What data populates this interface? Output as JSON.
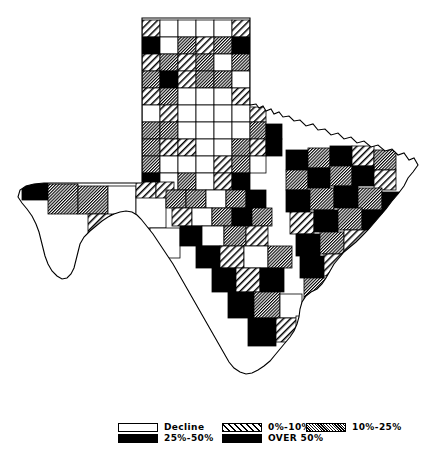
{
  "figure": {
    "kind": "choropleth-map",
    "region": "Texas",
    "unit": "county",
    "background_color": "#ffffff",
    "ink_color": "#000000"
  },
  "legend": {
    "groups": [
      {
        "name": "legend-group-1",
        "rows": [
          {
            "pattern": "white",
            "label": "Decline"
          },
          {
            "pattern": "black",
            "label": "25%-50%"
          }
        ]
      },
      {
        "name": "legend-group-2",
        "rows": [
          {
            "pattern": "diagonal-hatch",
            "label": "0%-10%"
          },
          {
            "pattern": "black",
            "label": "OVER 50%"
          }
        ]
      },
      {
        "name": "legend-group-3",
        "rows": [
          {
            "pattern": "dense-hatch",
            "label": "10%-25%"
          }
        ]
      }
    ]
  },
  "chart_data": {
    "type": "map",
    "title": "",
    "classes": [
      {
        "key": "decline",
        "label": "Decline",
        "pattern": "white"
      },
      {
        "key": "c0_10",
        "label": "0%-10%",
        "pattern": "diagonal-hatch"
      },
      {
        "key": "c10_25",
        "label": "10%-25%",
        "pattern": "dense-hatch"
      },
      {
        "key": "c25_50",
        "label": "25%-50%",
        "pattern": "black"
      },
      {
        "key": "over50",
        "label": "OVER 50%",
        "pattern": "black"
      }
    ],
    "regions": [
      {
        "id": "panhandle-r1c1",
        "cls": "c0_10",
        "x": 142,
        "y": 20,
        "w": 18,
        "h": 17
      },
      {
        "id": "panhandle-r1c2",
        "cls": "decline",
        "x": 160,
        "y": 20,
        "w": 18,
        "h": 17
      },
      {
        "id": "panhandle-r1c3",
        "cls": "decline",
        "x": 178,
        "y": 20,
        "w": 18,
        "h": 17
      },
      {
        "id": "panhandle-r1c4",
        "cls": "decline",
        "x": 196,
        "y": 20,
        "w": 18,
        "h": 17
      },
      {
        "id": "panhandle-r1c5",
        "cls": "decline",
        "x": 214,
        "y": 20,
        "w": 18,
        "h": 17
      },
      {
        "id": "panhandle-r1c6",
        "cls": "c0_10",
        "x": 232,
        "y": 20,
        "w": 18,
        "h": 17
      },
      {
        "id": "panhandle-r2c1",
        "cls": "over50",
        "x": 142,
        "y": 37,
        "w": 18,
        "h": 17
      },
      {
        "id": "panhandle-r2c2",
        "cls": "decline",
        "x": 160,
        "y": 37,
        "w": 18,
        "h": 17
      },
      {
        "id": "panhandle-r2c3",
        "cls": "c10_25",
        "x": 178,
        "y": 37,
        "w": 18,
        "h": 17
      },
      {
        "id": "panhandle-r2c4",
        "cls": "c0_10",
        "x": 196,
        "y": 37,
        "w": 18,
        "h": 17
      },
      {
        "id": "panhandle-r2c5",
        "cls": "c10_25",
        "x": 214,
        "y": 37,
        "w": 18,
        "h": 17
      },
      {
        "id": "panhandle-r2c6",
        "cls": "over50",
        "x": 232,
        "y": 37,
        "w": 18,
        "h": 17
      },
      {
        "id": "panhandle-r3c1",
        "cls": "c0_10",
        "x": 142,
        "y": 54,
        "w": 18,
        "h": 17
      },
      {
        "id": "panhandle-r3c2",
        "cls": "c10_25",
        "x": 160,
        "y": 54,
        "w": 18,
        "h": 17
      },
      {
        "id": "panhandle-r3c3",
        "cls": "c0_10",
        "x": 178,
        "y": 54,
        "w": 18,
        "h": 17
      },
      {
        "id": "panhandle-r3c4",
        "cls": "c10_25",
        "x": 196,
        "y": 54,
        "w": 18,
        "h": 17
      },
      {
        "id": "panhandle-r3c5",
        "cls": "decline",
        "x": 214,
        "y": 54,
        "w": 18,
        "h": 17
      },
      {
        "id": "panhandle-r3c6",
        "cls": "c10_25",
        "x": 232,
        "y": 54,
        "w": 18,
        "h": 17
      },
      {
        "id": "panhandle-r4c1",
        "cls": "c10_25",
        "x": 142,
        "y": 71,
        "w": 18,
        "h": 17
      },
      {
        "id": "panhandle-r4c2",
        "cls": "over50",
        "x": 160,
        "y": 71,
        "w": 18,
        "h": 17
      },
      {
        "id": "panhandle-r4c3",
        "cls": "c0_10",
        "x": 178,
        "y": 71,
        "w": 18,
        "h": 17
      },
      {
        "id": "panhandle-r4c4",
        "cls": "c10_25",
        "x": 196,
        "y": 71,
        "w": 18,
        "h": 17
      },
      {
        "id": "panhandle-r4c5",
        "cls": "c10_25",
        "x": 214,
        "y": 71,
        "w": 18,
        "h": 17
      },
      {
        "id": "panhandle-r4c6",
        "cls": "decline",
        "x": 232,
        "y": 71,
        "w": 18,
        "h": 17
      },
      {
        "id": "panhandle-r5c1",
        "cls": "c0_10",
        "x": 142,
        "y": 88,
        "w": 18,
        "h": 17
      },
      {
        "id": "panhandle-r5c2",
        "cls": "c10_25",
        "x": 160,
        "y": 88,
        "w": 18,
        "h": 17
      },
      {
        "id": "panhandle-r5c3",
        "cls": "decline",
        "x": 178,
        "y": 88,
        "w": 18,
        "h": 17
      },
      {
        "id": "panhandle-r5c4",
        "cls": "decline",
        "x": 196,
        "y": 88,
        "w": 18,
        "h": 17
      },
      {
        "id": "panhandle-r5c5",
        "cls": "decline",
        "x": 214,
        "y": 88,
        "w": 18,
        "h": 17
      },
      {
        "id": "panhandle-r5c6",
        "cls": "c0_10",
        "x": 232,
        "y": 88,
        "w": 18,
        "h": 17
      },
      {
        "id": "nw-r6c1",
        "cls": "decline",
        "x": 142,
        "y": 105,
        "w": 18,
        "h": 17
      },
      {
        "id": "nw-r6c2",
        "cls": "c0_10",
        "x": 160,
        "y": 105,
        "w": 18,
        "h": 17
      },
      {
        "id": "nw-r6c3",
        "cls": "decline",
        "x": 178,
        "y": 105,
        "w": 18,
        "h": 17
      },
      {
        "id": "nw-r6c4",
        "cls": "decline",
        "x": 196,
        "y": 105,
        "w": 18,
        "h": 17
      },
      {
        "id": "nw-r6c5",
        "cls": "decline",
        "x": 214,
        "y": 105,
        "w": 18,
        "h": 17
      },
      {
        "id": "nw-r6c6",
        "cls": "decline",
        "x": 232,
        "y": 105,
        "w": 18,
        "h": 17
      },
      {
        "id": "nw-r6c7",
        "cls": "c0_10",
        "x": 250,
        "y": 107,
        "w": 16,
        "h": 15
      },
      {
        "id": "nw-r7c1",
        "cls": "c10_25",
        "x": 142,
        "y": 122,
        "w": 18,
        "h": 17
      },
      {
        "id": "nw-r7c2",
        "cls": "c10_25",
        "x": 160,
        "y": 122,
        "w": 18,
        "h": 17
      },
      {
        "id": "nw-r7c3",
        "cls": "decline",
        "x": 178,
        "y": 122,
        "w": 18,
        "h": 17
      },
      {
        "id": "nw-r7c4",
        "cls": "decline",
        "x": 196,
        "y": 122,
        "w": 18,
        "h": 17
      },
      {
        "id": "nw-r7c5",
        "cls": "decline",
        "x": 214,
        "y": 122,
        "w": 18,
        "h": 17
      },
      {
        "id": "nw-r7c6",
        "cls": "decline",
        "x": 232,
        "y": 122,
        "w": 18,
        "h": 17
      },
      {
        "id": "nw-r7c7",
        "cls": "c10_25",
        "x": 250,
        "y": 122,
        "w": 16,
        "h": 17
      },
      {
        "id": "nw-r7c8",
        "cls": "over50",
        "x": 266,
        "y": 124,
        "w": 16,
        "h": 15
      },
      {
        "id": "nc-r8c1",
        "cls": "c10_25",
        "x": 142,
        "y": 139,
        "w": 18,
        "h": 17
      },
      {
        "id": "nc-r8c2",
        "cls": "c0_10",
        "x": 160,
        "y": 139,
        "w": 18,
        "h": 17
      },
      {
        "id": "nc-r8c3",
        "cls": "c0_10",
        "x": 178,
        "y": 139,
        "w": 18,
        "h": 17
      },
      {
        "id": "nc-r8c4",
        "cls": "decline",
        "x": 196,
        "y": 139,
        "w": 18,
        "h": 17
      },
      {
        "id": "nc-r8c5",
        "cls": "decline",
        "x": 214,
        "y": 139,
        "w": 18,
        "h": 17
      },
      {
        "id": "nc-r8c6",
        "cls": "c10_25",
        "x": 232,
        "y": 139,
        "w": 18,
        "h": 17
      },
      {
        "id": "nc-r8c7",
        "cls": "c0_10",
        "x": 250,
        "y": 139,
        "w": 16,
        "h": 17
      },
      {
        "id": "nc-r8c8",
        "cls": "over50",
        "x": 266,
        "y": 139,
        "w": 16,
        "h": 17
      },
      {
        "id": "nc-r9c1",
        "cls": "c10_25",
        "x": 142,
        "y": 156,
        "w": 18,
        "h": 17
      },
      {
        "id": "nc-r9c2",
        "cls": "decline",
        "x": 160,
        "y": 156,
        "w": 18,
        "h": 17
      },
      {
        "id": "nc-r9c3",
        "cls": "decline",
        "x": 178,
        "y": 156,
        "w": 18,
        "h": 17
      },
      {
        "id": "nc-r9c4",
        "cls": "decline",
        "x": 196,
        "y": 156,
        "w": 18,
        "h": 17
      },
      {
        "id": "nc-r9c5",
        "cls": "c0_10",
        "x": 214,
        "y": 156,
        "w": 18,
        "h": 17
      },
      {
        "id": "nc-r9c6",
        "cls": "c10_25",
        "x": 232,
        "y": 156,
        "w": 18,
        "h": 17
      },
      {
        "id": "nc-r9c7",
        "cls": "decline",
        "x": 250,
        "y": 156,
        "w": 16,
        "h": 17
      },
      {
        "id": "nc-r10c1",
        "cls": "over50",
        "x": 142,
        "y": 173,
        "w": 18,
        "h": 17
      },
      {
        "id": "nc-r10c2",
        "cls": "decline",
        "x": 160,
        "y": 173,
        "w": 18,
        "h": 17
      },
      {
        "id": "nc-r10c3",
        "cls": "c10_25",
        "x": 178,
        "y": 173,
        "w": 18,
        "h": 17
      },
      {
        "id": "nc-r10c4",
        "cls": "decline",
        "x": 196,
        "y": 173,
        "w": 18,
        "h": 17
      },
      {
        "id": "nc-r10c5",
        "cls": "c0_10",
        "x": 214,
        "y": 173,
        "w": 18,
        "h": 17
      },
      {
        "id": "nc-r10c6",
        "cls": "over50",
        "x": 232,
        "y": 173,
        "w": 18,
        "h": 17
      },
      {
        "id": "wtx-elpaso",
        "cls": "over50",
        "x": 22,
        "y": 182,
        "w": 26,
        "h": 18
      },
      {
        "id": "wtx-hudspeth",
        "cls": "c10_25",
        "x": 48,
        "y": 184,
        "w": 30,
        "h": 30
      },
      {
        "id": "wtx-culberson",
        "cls": "c10_25",
        "x": 78,
        "y": 186,
        "w": 30,
        "h": 28
      },
      {
        "id": "wtx-reeves",
        "cls": "decline",
        "x": 108,
        "y": 186,
        "w": 28,
        "h": 32
      },
      {
        "id": "wtx-jeffdavis",
        "cls": "c0_10",
        "x": 88,
        "y": 214,
        "w": 30,
        "h": 28
      },
      {
        "id": "wtx-presidio",
        "cls": "c0_10",
        "x": 84,
        "y": 242,
        "w": 30,
        "h": 40
      },
      {
        "id": "wtx-brewster",
        "cls": "decline",
        "x": 114,
        "y": 218,
        "w": 36,
        "h": 58
      },
      {
        "id": "wtx-pecos",
        "cls": "decline",
        "x": 136,
        "y": 196,
        "w": 30,
        "h": 32
      },
      {
        "id": "wtx-terrell",
        "cls": "decline",
        "x": 150,
        "y": 228,
        "w": 30,
        "h": 30
      },
      {
        "id": "wtx-ward",
        "cls": "c0_10",
        "x": 136,
        "y": 182,
        "w": 20,
        "h": 16
      },
      {
        "id": "wtx-crane",
        "cls": "c0_10",
        "x": 156,
        "y": 182,
        "w": 18,
        "h": 16
      },
      {
        "id": "ctx-a1",
        "cls": "c10_25",
        "x": 166,
        "y": 190,
        "w": 20,
        "h": 18
      },
      {
        "id": "ctx-a2",
        "cls": "c10_25",
        "x": 186,
        "y": 190,
        "w": 20,
        "h": 18
      },
      {
        "id": "ctx-a3",
        "cls": "decline",
        "x": 206,
        "y": 190,
        "w": 20,
        "h": 18
      },
      {
        "id": "ctx-a4",
        "cls": "c10_25",
        "x": 226,
        "y": 190,
        "w": 20,
        "h": 18
      },
      {
        "id": "ctx-a5",
        "cls": "over50",
        "x": 246,
        "y": 190,
        "w": 20,
        "h": 18
      },
      {
        "id": "ctx-b1",
        "cls": "c0_10",
        "x": 172,
        "y": 208,
        "w": 20,
        "h": 18
      },
      {
        "id": "ctx-b2",
        "cls": "decline",
        "x": 192,
        "y": 208,
        "w": 20,
        "h": 18
      },
      {
        "id": "ctx-b3",
        "cls": "c10_25",
        "x": 212,
        "y": 208,
        "w": 20,
        "h": 18
      },
      {
        "id": "ctx-b4",
        "cls": "over50",
        "x": 232,
        "y": 208,
        "w": 20,
        "h": 18
      },
      {
        "id": "ctx-b5",
        "cls": "c10_25",
        "x": 252,
        "y": 208,
        "w": 20,
        "h": 18
      },
      {
        "id": "ctx-c1",
        "cls": "over50",
        "x": 180,
        "y": 226,
        "w": 22,
        "h": 20
      },
      {
        "id": "ctx-c2",
        "cls": "decline",
        "x": 202,
        "y": 226,
        "w": 22,
        "h": 20
      },
      {
        "id": "ctx-c3",
        "cls": "c10_25",
        "x": 224,
        "y": 226,
        "w": 22,
        "h": 20
      },
      {
        "id": "ctx-c4",
        "cls": "c0_10",
        "x": 246,
        "y": 226,
        "w": 22,
        "h": 20
      },
      {
        "id": "stx-d1",
        "cls": "over50",
        "x": 196,
        "y": 246,
        "w": 24,
        "h": 22
      },
      {
        "id": "stx-d2",
        "cls": "c0_10",
        "x": 220,
        "y": 246,
        "w": 24,
        "h": 22
      },
      {
        "id": "stx-d3",
        "cls": "decline",
        "x": 244,
        "y": 246,
        "w": 24,
        "h": 22
      },
      {
        "id": "stx-d4",
        "cls": "c10_25",
        "x": 268,
        "y": 246,
        "w": 24,
        "h": 22
      },
      {
        "id": "stx-e1",
        "cls": "over50",
        "x": 212,
        "y": 268,
        "w": 24,
        "h": 24
      },
      {
        "id": "stx-e2",
        "cls": "c0_10",
        "x": 236,
        "y": 268,
        "w": 24,
        "h": 24
      },
      {
        "id": "stx-e3",
        "cls": "over50",
        "x": 260,
        "y": 268,
        "w": 24,
        "h": 24
      },
      {
        "id": "stx-f1",
        "cls": "over50",
        "x": 228,
        "y": 292,
        "w": 26,
        "h": 26
      },
      {
        "id": "stx-f2",
        "cls": "c10_25",
        "x": 254,
        "y": 292,
        "w": 26,
        "h": 26
      },
      {
        "id": "stx-f3",
        "cls": "decline",
        "x": 280,
        "y": 294,
        "w": 22,
        "h": 24
      },
      {
        "id": "stx-g1",
        "cls": "over50",
        "x": 248,
        "y": 318,
        "w": 28,
        "h": 28
      },
      {
        "id": "stx-g2",
        "cls": "c0_10",
        "x": 276,
        "y": 318,
        "w": 24,
        "h": 24
      },
      {
        "id": "stx-g3",
        "cls": "decline",
        "x": 296,
        "y": 316,
        "w": 20,
        "h": 26
      },
      {
        "id": "etx-h1",
        "cls": "over50",
        "x": 286,
        "y": 150,
        "w": 22,
        "h": 20
      },
      {
        "id": "etx-h2",
        "cls": "c10_25",
        "x": 308,
        "y": 148,
        "w": 22,
        "h": 20
      },
      {
        "id": "etx-h3",
        "cls": "over50",
        "x": 330,
        "y": 146,
        "w": 22,
        "h": 20
      },
      {
        "id": "etx-h4",
        "cls": "c0_10",
        "x": 352,
        "y": 146,
        "w": 22,
        "h": 20
      },
      {
        "id": "etx-h5",
        "cls": "c10_25",
        "x": 374,
        "y": 150,
        "w": 22,
        "h": 20
      },
      {
        "id": "etx-i1",
        "cls": "c10_25",
        "x": 286,
        "y": 170,
        "w": 22,
        "h": 20
      },
      {
        "id": "etx-i2",
        "cls": "over50",
        "x": 308,
        "y": 168,
        "w": 22,
        "h": 20
      },
      {
        "id": "etx-i3",
        "cls": "c10_25",
        "x": 330,
        "y": 166,
        "w": 22,
        "h": 20
      },
      {
        "id": "etx-i4",
        "cls": "over50",
        "x": 352,
        "y": 166,
        "w": 22,
        "h": 20
      },
      {
        "id": "etx-i5",
        "cls": "c0_10",
        "x": 374,
        "y": 170,
        "w": 22,
        "h": 20
      },
      {
        "id": "etx-j1",
        "cls": "over50",
        "x": 286,
        "y": 190,
        "w": 24,
        "h": 22
      },
      {
        "id": "etx-j2",
        "cls": "c10_25",
        "x": 310,
        "y": 188,
        "w": 24,
        "h": 22
      },
      {
        "id": "etx-j3",
        "cls": "over50",
        "x": 334,
        "y": 186,
        "w": 24,
        "h": 22
      },
      {
        "id": "etx-j4",
        "cls": "c10_25",
        "x": 358,
        "y": 188,
        "w": 24,
        "h": 22
      },
      {
        "id": "etx-j5",
        "cls": "over50",
        "x": 382,
        "y": 192,
        "w": 20,
        "h": 22
      },
      {
        "id": "etx-k1",
        "cls": "c0_10",
        "x": 290,
        "y": 212,
        "w": 24,
        "h": 22
      },
      {
        "id": "etx-k2",
        "cls": "over50",
        "x": 314,
        "y": 210,
        "w": 24,
        "h": 22
      },
      {
        "id": "etx-k3",
        "cls": "c10_25",
        "x": 338,
        "y": 208,
        "w": 24,
        "h": 22
      },
      {
        "id": "etx-k4",
        "cls": "over50",
        "x": 362,
        "y": 210,
        "w": 24,
        "h": 22
      },
      {
        "id": "etx-l1",
        "cls": "over50",
        "x": 296,
        "y": 234,
        "w": 24,
        "h": 22
      },
      {
        "id": "etx-l2",
        "cls": "c10_25",
        "x": 320,
        "y": 232,
        "w": 24,
        "h": 22
      },
      {
        "id": "etx-l3",
        "cls": "c0_10",
        "x": 344,
        "y": 230,
        "w": 24,
        "h": 22
      },
      {
        "id": "etx-l4",
        "cls": "over50",
        "x": 368,
        "y": 232,
        "w": 22,
        "h": 22
      },
      {
        "id": "gulf-m1",
        "cls": "over50",
        "x": 300,
        "y": 256,
        "w": 24,
        "h": 22
      },
      {
        "id": "gulf-m2",
        "cls": "c0_10",
        "x": 324,
        "y": 254,
        "w": 24,
        "h": 22
      },
      {
        "id": "gulf-m3",
        "cls": "over50",
        "x": 348,
        "y": 252,
        "w": 24,
        "h": 22
      },
      {
        "id": "gulf-n1",
        "cls": "c10_25",
        "x": 304,
        "y": 278,
        "w": 24,
        "h": 22
      },
      {
        "id": "gulf-n2",
        "cls": "over50",
        "x": 328,
        "y": 276,
        "w": 24,
        "h": 22
      },
      {
        "id": "gulf-n3",
        "cls": "decline",
        "x": 352,
        "y": 274,
        "w": 16,
        "h": 18
      }
    ]
  }
}
